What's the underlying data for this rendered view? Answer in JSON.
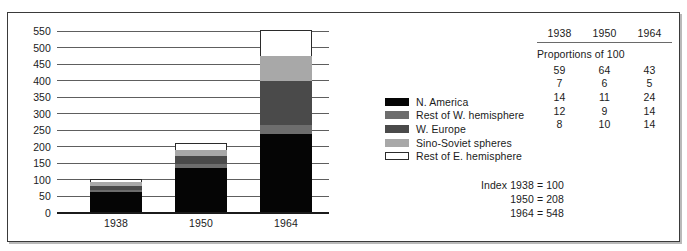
{
  "chart_data": {
    "type": "bar",
    "subtype": "stacked-bar",
    "title": "",
    "xlabel": "",
    "ylabel": "",
    "ylim": [
      0,
      550
    ],
    "ytick_step": 50,
    "grid": true,
    "legend_position": "right",
    "categories": [
      "1938",
      "1950",
      "1964"
    ],
    "yticks": [
      "550",
      "500",
      "450",
      "400",
      "350",
      "300",
      "250",
      "200",
      "150",
      "100",
      "50",
      "0"
    ],
    "series": [
      {
        "name": "N. America",
        "color": "#050505",
        "proportions": [
          59,
          64,
          43
        ],
        "values": [
          59,
          133,
          236
        ]
      },
      {
        "name": "Rest of W. hemisphere",
        "color": "#6d6d6d",
        "proportions": [
          7,
          6,
          5
        ],
        "values": [
          7,
          12,
          27
        ]
      },
      {
        "name": "W. Europe",
        "color": "#4a4a4a",
        "proportions": [
          14,
          11,
          24
        ],
        "values": [
          14,
          23,
          132
        ]
      },
      {
        "name": "Sino-Soviet spheres",
        "color": "#a8a8a8",
        "proportions": [
          12,
          9,
          14
        ],
        "values": [
          12,
          19,
          77
        ]
      },
      {
        "name": "Rest of E. hemisphere",
        "color": "#ffffff",
        "proportions": [
          8,
          10,
          14
        ],
        "values": [
          8,
          21,
          77
        ]
      }
    ],
    "totals": [
      100,
      208,
      548
    ],
    "annotations": [
      "Index 1938 = 100",
      "1950 = 208",
      "1964 = 548"
    ]
  },
  "legend": {
    "items": [
      {
        "label": "N. America",
        "swatch": "legend-swatch-n-america"
      },
      {
        "label": "Rest of W. hemisphere",
        "swatch": "legend-swatch-rest-w-hemisphere"
      },
      {
        "label": "W. Europe",
        "swatch": "legend-swatch-w-europe"
      },
      {
        "label": "Sino-Soviet spheres",
        "swatch": "legend-swatch-sino-soviet"
      },
      {
        "label": "Rest of E. hemisphere",
        "swatch": "legend-swatch-rest-e-hemisphere"
      }
    ]
  },
  "table": {
    "headers": [
      "1938",
      "1950",
      "1964"
    ],
    "caption": "Proportions of 100",
    "rows": [
      {
        "cells": [
          "59",
          "64",
          "43"
        ]
      },
      {
        "cells": [
          "7",
          "6",
          "5"
        ]
      },
      {
        "cells": [
          "14",
          "11",
          "24"
        ]
      },
      {
        "cells": [
          "12",
          "9",
          "14"
        ]
      },
      {
        "cells": [
          "8",
          "10",
          "14"
        ]
      }
    ]
  },
  "index_note": {
    "lines": [
      "Index 1938 = 100",
      "1950 = 208",
      "1964 = 548"
    ]
  }
}
